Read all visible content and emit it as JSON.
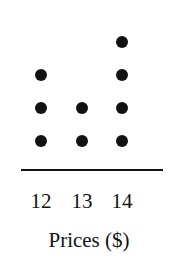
{
  "chart_data": {
    "type": "scatter",
    "plot_kind": "dot-plot",
    "title": "",
    "subtitle": "",
    "xlabel": "Prices ($)",
    "ylabel": "",
    "categories": [
      "12",
      "13",
      "14"
    ],
    "values": [
      3,
      2,
      4
    ],
    "tick_labels": [
      "12",
      "13",
      "14"
    ],
    "x": [
      12,
      13,
      14
    ],
    "counts": [
      3,
      2,
      4
    ],
    "total_dots": 9,
    "xlim": [
      11.5,
      14.5
    ],
    "ylim": [
      0,
      4
    ],
    "grid": false,
    "legend": null,
    "annotations": [],
    "dot_color": "#121212",
    "axis_color": "#121212",
    "background_color": "#ffffff",
    "columns": [
      {
        "label": "12",
        "value": 12,
        "count": 3,
        "center_x": 41,
        "dot_rows_y": [
          75,
          108,
          141
        ]
      },
      {
        "label": "13",
        "value": 13,
        "count": 2,
        "center_x": 82,
        "dot_rows_y": [
          108,
          141
        ]
      },
      {
        "label": "14",
        "value": 14,
        "count": 4,
        "center_x": 122,
        "dot_rows_y": [
          42,
          75,
          108,
          141
        ]
      }
    ]
  },
  "axis": {
    "line_left": 21,
    "line_width": 142,
    "line_top": 169
  }
}
